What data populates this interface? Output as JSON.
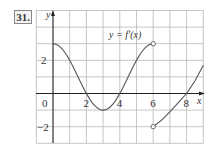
{
  "problem_number": "31.",
  "chart_data": {
    "type": "line",
    "title": "y = f′(x)",
    "xlabel": "x",
    "ylabel": "y",
    "xlim": [
      -1,
      9
    ],
    "ylim": [
      -3,
      5
    ],
    "grid": true,
    "x_tick_labels": [
      {
        "value": 0,
        "label": "0"
      },
      {
        "value": 2,
        "label": "2"
      },
      {
        "value": 4,
        "label": "4"
      },
      {
        "value": 6,
        "label": "6"
      },
      {
        "value": 8,
        "label": "8"
      }
    ],
    "y_tick_labels": [
      {
        "value": 2,
        "label": "2"
      },
      {
        "value": -2,
        "label": "−2"
      }
    ],
    "series": [
      {
        "name": "f′(x) on [0,6)",
        "x": [
          0,
          0.5,
          1,
          1.5,
          2,
          2.5,
          3,
          3.5,
          4,
          4.5,
          5,
          5.5,
          6
        ],
        "y": [
          3,
          2.73,
          2,
          1,
          0,
          -0.73,
          -1,
          -0.73,
          0,
          1,
          2,
          2.73,
          3
        ],
        "end_marker": {
          "x": 6,
          "y": 3,
          "type": "open"
        }
      },
      {
        "name": "f′(x) on (6,9]",
        "x": [
          6,
          6.5,
          7,
          7.5,
          8,
          8.5,
          9
        ],
        "y": [
          -2,
          -1.6,
          -1.1,
          -0.55,
          0,
          0.75,
          1.7
        ],
        "start_marker": {
          "x": 6,
          "y": -2,
          "type": "open"
        }
      }
    ],
    "annotations": [
      {
        "text": "y = f′(x)",
        "x": 4.6,
        "y": 3.5
      }
    ]
  },
  "colors": {
    "grid": "#b8b8b8",
    "curve": "#555555",
    "axis": "#222222",
    "text": "#333333"
  }
}
